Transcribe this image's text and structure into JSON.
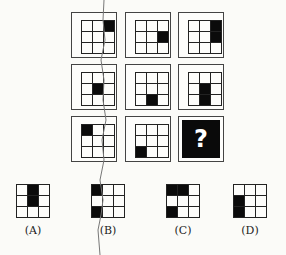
{
  "puzzle": {
    "matrix": [
      [
        {
          "filled": [
            2
          ]
        },
        {
          "filled": [
            5
          ]
        },
        {
          "filled": [
            2,
            5
          ]
        }
      ],
      [
        {
          "filled": [
            4
          ]
        },
        {
          "filled": [
            7
          ]
        },
        {
          "filled": [
            4,
            7
          ]
        }
      ],
      [
        {
          "filled": [
            0
          ]
        },
        {
          "filled": [
            6
          ]
        },
        {
          "question": "?"
        }
      ]
    ],
    "options": [
      {
        "label": "(A)",
        "filled": [
          1,
          4
        ]
      },
      {
        "label": "(B)",
        "filled": [
          0,
          6
        ]
      },
      {
        "label": "(C)",
        "filled": [
          0,
          1,
          6
        ]
      },
      {
        "label": "(D)",
        "filled": [
          3,
          6
        ]
      }
    ],
    "question_mark": "?"
  }
}
